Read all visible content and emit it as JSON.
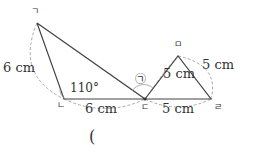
{
  "diagram": {
    "vertices": {
      "giyeok": {
        "label": "ㄱ",
        "x": 37,
        "y": 23
      },
      "nieun": {
        "label": "ㄴ",
        "x": 64,
        "y": 99
      },
      "digeut": {
        "label": "ㄷ",
        "x": 145,
        "y": 99
      },
      "rieul": {
        "label": "ㄹ",
        "x": 211,
        "y": 99
      },
      "mieum": {
        "label": "ㅁ",
        "x": 178,
        "y": 56
      }
    },
    "measurements": {
      "left_side": "6 cm",
      "bottom_left": "6 cm",
      "angle": "110°",
      "right_inner": "5 cm",
      "right_outer": "5 cm",
      "bottom_right": "5 cm"
    },
    "angle_marker": "㉠",
    "answer_paren": "("
  }
}
